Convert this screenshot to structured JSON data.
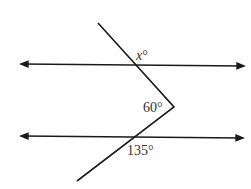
{
  "diagram": {
    "labels": {
      "top_angle": "x°",
      "vertex_angle": "60°",
      "bottom_angle": "135°"
    },
    "colors": {
      "stroke": "#1a1a1a",
      "text": "#333333",
      "background": "#ffffff"
    }
  }
}
